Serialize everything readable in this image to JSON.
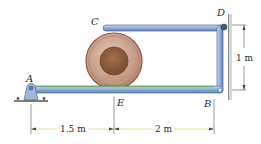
{
  "diagram": {
    "type": "mechanics-frame",
    "points": {
      "A": "A",
      "B": "B",
      "C": "C",
      "D": "D",
      "E": "E"
    },
    "dimensions": {
      "AE": "1.5 m",
      "EB": "2 m",
      "BD": "1 m"
    },
    "colors": {
      "member_fill": "#8fb0d8",
      "member_edge": "#4a6e9e",
      "member_highlight": "#c9dcf2",
      "green_stripe": "#6fae7a",
      "spool_outer": "#c8a08c",
      "spool_rim": "#8a5a44",
      "spool_inner": "#8a5a3c",
      "wall": "#9a9a9a",
      "support": "#9fb7d6",
      "dim_line": "#444444",
      "dim_yellow": "#d9d27a"
    }
  }
}
